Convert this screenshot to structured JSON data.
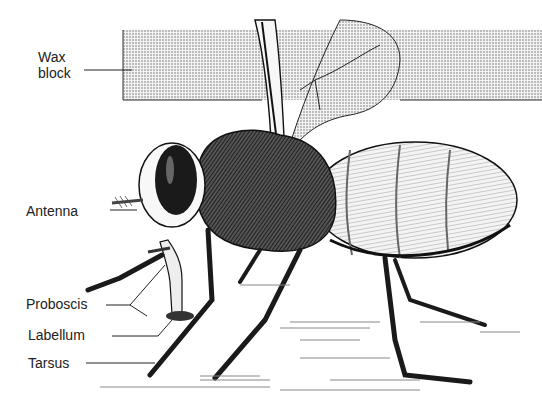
{
  "figure": {
    "labels": [
      {
        "id": "wax-block",
        "text": "Wax\nblock",
        "x": 38,
        "y": 49
      },
      {
        "id": "antenna",
        "text": "Antenna",
        "x": 26,
        "y": 203
      },
      {
        "id": "proboscis",
        "text": "Proboscis",
        "x": 26,
        "y": 296
      },
      {
        "id": "labellum",
        "text": "Labellum",
        "x": 28,
        "y": 327
      },
      {
        "id": "tarsus",
        "text": "Tarsus",
        "x": 28,
        "y": 355
      }
    ],
    "colors": {
      "ink": "#1a1a1a",
      "wax_fill": "#c9c9c9",
      "background": "#ffffff"
    }
  }
}
